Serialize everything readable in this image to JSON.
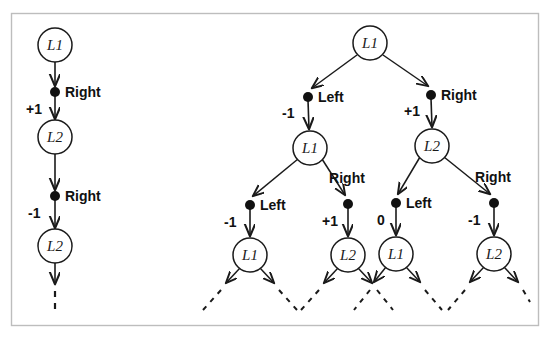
{
  "figure": {
    "background": "#ffffff",
    "frame_color": "#b9b9b9",
    "ink_color": "#1a1a1a"
  },
  "chain": {
    "name": "left-single-path",
    "nodes": [
      {
        "id": "c0",
        "label": "L1",
        "cx": 55,
        "cy": 45
      },
      {
        "id": "c1",
        "label": "L2",
        "cx": 55,
        "cy": 137
      },
      {
        "id": "c2",
        "label": "L2",
        "cx": 55,
        "cy": 246
      }
    ],
    "dots": [
      {
        "id": "cd0",
        "cx": 55,
        "cy": 92,
        "action": "Right",
        "reward": "+1"
      },
      {
        "id": "cd1",
        "cx": 55,
        "cy": 196,
        "action": "Right",
        "reward": "-1"
      }
    ],
    "continuation": {
      "label": "dashed-continuation",
      "x": 55,
      "y1": 286,
      "y2": 314
    }
  },
  "tree": {
    "name": "right-branching-tree",
    "root": {
      "id": "t0",
      "label": "L1",
      "cx": 370,
      "cy": 43
    },
    "level2": [
      {
        "id": "t1",
        "label": "L1",
        "cx": 310,
        "cy": 148
      },
      {
        "id": "t2",
        "label": "L2",
        "cx": 432,
        "cy": 146
      }
    ],
    "level3": [
      {
        "id": "t3",
        "label": "L1",
        "cx": 250,
        "cy": 255
      },
      {
        "id": "t4",
        "label": "L2",
        "cx": 348,
        "cy": 255
      },
      {
        "id": "t5",
        "label": "L1",
        "cx": 396,
        "cy": 254
      },
      {
        "id": "t6",
        "label": "L2",
        "cx": 494,
        "cy": 254
      }
    ],
    "dots_level2": [
      {
        "id": "td0",
        "cx": 308,
        "cy": 97,
        "action": "Left",
        "reward": "-1",
        "action_x": 318,
        "action_y": 101,
        "reward_x": 282,
        "reward_y": 117
      },
      {
        "id": "td1",
        "cx": 431,
        "cy": 95,
        "action": "Right",
        "reward": "+1",
        "action_x": 441,
        "action_y": 99,
        "reward_x": 404,
        "reward_y": 115
      }
    ],
    "dots_level3": [
      {
        "id": "td2",
        "cx": 250,
        "cy": 205,
        "action": "Left",
        "reward": "-1",
        "action_x": 260,
        "action_y": 209,
        "reward_x": 224,
        "reward_y": 226
      },
      {
        "id": "td3",
        "cx": 348,
        "cy": 204,
        "action": "Right",
        "reward": "+1",
        "action_x": 347,
        "action_y": 180,
        "reward_x": 322,
        "reward_y": 225
      },
      {
        "id": "td4",
        "cx": 396,
        "cy": 203,
        "action": "Left",
        "reward": "0",
        "action_x": 406,
        "action_y": 207,
        "reward_x": 376,
        "reward_y": 224
      },
      {
        "id": "td5",
        "cx": 494,
        "cy": 203,
        "action": "Right",
        "reward": "-1",
        "action_x": 493,
        "action_y": 179,
        "reward_x": 468,
        "reward_y": 224
      }
    ]
  },
  "labels": {
    "node_L1": "L1",
    "node_L2": "L2",
    "action_left": "Left",
    "action_right": "Right",
    "reward_plus1": "+1",
    "reward_minus1": "-1",
    "reward_zero": "0"
  }
}
